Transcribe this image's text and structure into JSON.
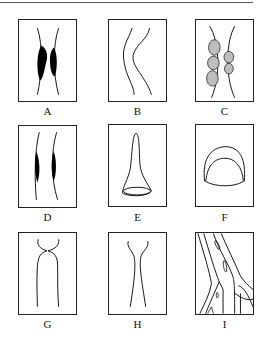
{
  "figure": {
    "panels": [
      {
        "id": "A",
        "label": "A",
        "description": "vessel walls with dark irregular masses narrowing lumen"
      },
      {
        "id": "B",
        "label": "B",
        "description": "curved tortuous vessel walls"
      },
      {
        "id": "C",
        "label": "C",
        "description": "vessel walls with grey round nodules along lumen"
      },
      {
        "id": "D",
        "label": "D",
        "description": "vessel walls with dark fusiform wall thickening"
      },
      {
        "id": "E",
        "label": "E",
        "description": "funnel/flask shaped pouch"
      },
      {
        "id": "F",
        "label": "F",
        "description": "dome shaped double contour"
      },
      {
        "id": "G",
        "label": "G",
        "description": "vessel with abrupt constriction at top"
      },
      {
        "id": "H",
        "label": "H",
        "description": "vessel with gradual hourglass narrowing"
      },
      {
        "id": "I",
        "label": "I",
        "description": "branching vessels with intraluminal streaks"
      }
    ]
  },
  "colors": {
    "line": "#111111",
    "mass": "#000000",
    "nodule": "#bdbdbd"
  }
}
